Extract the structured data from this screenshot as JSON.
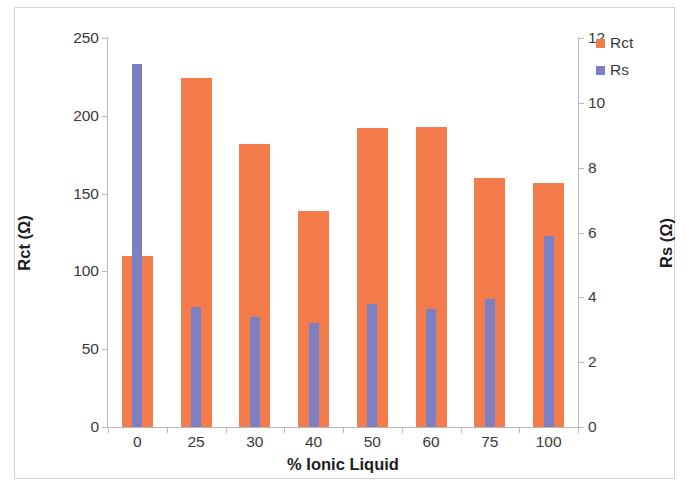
{
  "chart_data": {
    "type": "bar",
    "title": "",
    "xlabel": "% Ionic Liquid",
    "ylabel": "Rct (Ω)",
    "y2label": "Rs (Ω)",
    "categories": [
      "0",
      "25",
      "30",
      "40",
      "50",
      "60",
      "75",
      "100"
    ],
    "series": [
      {
        "name": "Rct",
        "axis": "left",
        "color": "#F47B4A",
        "values": [
          110,
          224,
          182,
          139,
          192,
          193,
          160,
          157
        ]
      },
      {
        "name": "Rs",
        "axis": "right",
        "color": "#7B7FC4",
        "values": [
          11.2,
          3.7,
          3.4,
          3.2,
          3.8,
          3.65,
          3.95,
          5.9
        ]
      }
    ],
    "ylim": [
      0,
      250
    ],
    "y2lim": [
      0,
      12
    ],
    "yticks": [
      0,
      50,
      100,
      150,
      200,
      250
    ],
    "y2ticks": [
      0,
      2,
      4,
      6,
      8,
      10,
      12
    ],
    "ytick_labels": [
      "0",
      "50",
      "100",
      "150",
      "200",
      "250"
    ],
    "y2tick_labels": [
      "0",
      "2",
      "4",
      "6",
      "8",
      "10",
      "12"
    ],
    "grid": false,
    "legend_position": "top-right",
    "legend": [
      "Rct",
      "Rs"
    ]
  },
  "axes": {
    "left_title": "Rct (Ω)",
    "right_title": "Rs (Ω)",
    "x_title": "% Ionic Liquid"
  },
  "legend": {
    "items": [
      {
        "label": "Rct",
        "color": "#F47B4A"
      },
      {
        "label": "Rs",
        "color": "#7B7FC4"
      }
    ]
  }
}
